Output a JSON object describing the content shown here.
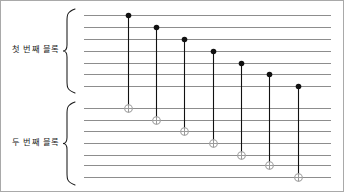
{
  "figure": {
    "kind": "quantum-circuit-diagram",
    "width": 344,
    "height": 192,
    "background_color": "#ffffff",
    "border_color": "#a9a9a9"
  },
  "labels": {
    "block_1": "첫 번째 블록",
    "block_2": "두 번째 블록"
  },
  "colors": {
    "wire": "#8d8d8d",
    "control_dot": "#111111",
    "gate_stem": "#111111",
    "target_ring": "#9a9a9a",
    "brace": "#1a1a1a",
    "text": "#1a1a1a"
  },
  "chart_data": {
    "type": "diagram",
    "title": "",
    "xlabel": "",
    "ylabel": "",
    "wire_x_start": 83,
    "wire_x_end": 330,
    "blocks": [
      {
        "name": "block_1",
        "label": "첫 번째 블록",
        "brace_top": 8,
        "brace_bottom": 92,
        "wire_y": [
          14,
          26,
          38,
          50,
          62,
          73,
          85
        ]
      },
      {
        "name": "block_2",
        "label": "두 번째 블록",
        "brace_top": 101,
        "brace_bottom": 184,
        "wire_y": [
          107,
          119,
          130,
          142,
          154,
          164,
          176
        ]
      }
    ],
    "gates": [
      {
        "type": "cnot",
        "index": 1,
        "x": 127,
        "control_y": 14,
        "target_y": 107
      },
      {
        "type": "cnot",
        "index": 2,
        "x": 155,
        "control_y": 26,
        "target_y": 119
      },
      {
        "type": "cnot",
        "index": 3,
        "x": 183,
        "control_y": 38,
        "target_y": 130
      },
      {
        "type": "cnot",
        "index": 4,
        "x": 212,
        "control_y": 50,
        "target_y": 142
      },
      {
        "type": "cnot",
        "index": 5,
        "x": 240,
        "control_y": 62,
        "target_y": 154
      },
      {
        "type": "cnot",
        "index": 6,
        "x": 268,
        "control_y": 73,
        "target_y": 164
      },
      {
        "type": "cnot",
        "index": 7,
        "x": 297,
        "control_y": 85,
        "target_y": 176
      }
    ],
    "control_dot_radius": 2.8,
    "target_ring_radius": 3.8
  }
}
